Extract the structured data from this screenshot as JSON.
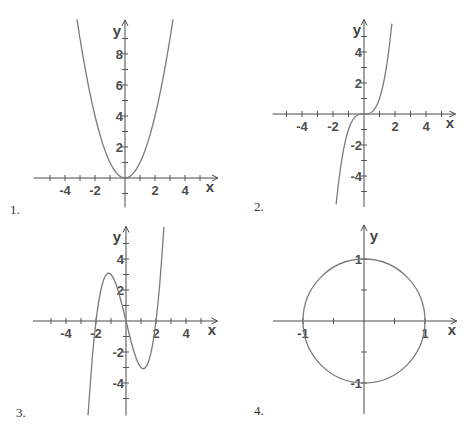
{
  "figure": {
    "panels": [
      {
        "label": "1."
      },
      {
        "label": "2."
      },
      {
        "label": "3."
      },
      {
        "label": "4."
      }
    ]
  },
  "colors": {
    "axis": "#4a4a4a",
    "curve": "#7a7a7a",
    "text": "#4d4d4d"
  },
  "chart_data": [
    {
      "type": "line",
      "title": "1.",
      "function": "y = x^2",
      "xlabel": "x",
      "ylabel": "y",
      "grid": false,
      "xlim": [
        -6.1,
        6.2
      ],
      "ylim": [
        -1.9,
        10.2
      ],
      "xticks": [
        -5,
        -4,
        -3,
        -2,
        -1,
        1,
        2,
        3,
        4,
        5
      ],
      "yticks": [
        -1,
        1,
        2,
        3,
        4,
        5,
        6,
        7,
        8,
        9
      ],
      "xtick_labels": [
        {
          "value": -4,
          "text": "-4"
        },
        {
          "value": -2,
          "text": "-2"
        },
        {
          "value": 2,
          "text": "2"
        },
        {
          "value": 4,
          "text": "4"
        }
      ],
      "ytick_labels": [
        {
          "value": 2,
          "text": "2"
        },
        {
          "value": 4,
          "text": "4"
        },
        {
          "value": 6,
          "text": "6"
        },
        {
          "value": 8,
          "text": "8"
        }
      ],
      "points": [
        [
          -3.2,
          10.24
        ],
        [
          -3.0,
          9
        ],
        [
          -2.8,
          7.84
        ],
        [
          -2.6,
          6.76
        ],
        [
          -2.4,
          5.76
        ],
        [
          -2.2,
          4.84
        ],
        [
          -2.0,
          4
        ],
        [
          -1.8,
          3.24
        ],
        [
          -1.6,
          2.56
        ],
        [
          -1.4,
          1.96
        ],
        [
          -1.2,
          1.44
        ],
        [
          -1.0,
          1
        ],
        [
          -0.8,
          0.64
        ],
        [
          -0.6,
          0.36
        ],
        [
          -0.4,
          0.16
        ],
        [
          -0.2,
          0.04
        ],
        [
          0,
          0
        ],
        [
          0.2,
          0.04
        ],
        [
          0.4,
          0.16
        ],
        [
          0.6,
          0.36
        ],
        [
          0.8,
          0.64
        ],
        [
          1.0,
          1
        ],
        [
          1.2,
          1.44
        ],
        [
          1.4,
          1.96
        ],
        [
          1.6,
          2.56
        ],
        [
          1.8,
          3.24
        ],
        [
          2.0,
          4
        ],
        [
          2.2,
          4.84
        ],
        [
          2.4,
          5.76
        ],
        [
          2.6,
          6.76
        ],
        [
          2.8,
          7.84
        ],
        [
          3.0,
          9
        ],
        [
          3.2,
          10.24
        ]
      ]
    },
    {
      "type": "line",
      "title": "2.",
      "function": "y = x^3",
      "xlabel": "x",
      "ylabel": "y",
      "grid": false,
      "xlim": [
        -5.9,
        5.9
      ],
      "ylim": [
        -6.0,
        6.1
      ],
      "xticks": [
        -5,
        -4,
        -3,
        -2,
        -1,
        1,
        2,
        3,
        4,
        5
      ],
      "yticks": [
        -5,
        -4,
        -3,
        -2,
        -1,
        1,
        2,
        3,
        4,
        5
      ],
      "xtick_labels": [
        {
          "value": -4,
          "text": "-4"
        },
        {
          "value": -2,
          "text": "-2"
        },
        {
          "value": 2,
          "text": "2"
        },
        {
          "value": 4,
          "text": "4"
        }
      ],
      "ytick_labels": [
        {
          "value": 4,
          "text": "4"
        },
        {
          "value": 2,
          "text": "2"
        },
        {
          "value": -2,
          "text": "-2"
        },
        {
          "value": -4,
          "text": "-4"
        }
      ],
      "points": [
        [
          -1.8,
          -5.832
        ],
        [
          -1.6,
          -4.096
        ],
        [
          -1.4,
          -2.744
        ],
        [
          -1.2,
          -1.728
        ],
        [
          -1.0,
          -1
        ],
        [
          -0.8,
          -0.512
        ],
        [
          -0.6,
          -0.216
        ],
        [
          -0.4,
          -0.064
        ],
        [
          -0.2,
          -0.008
        ],
        [
          0,
          0
        ],
        [
          0.2,
          0.008
        ],
        [
          0.4,
          0.064
        ],
        [
          0.6,
          0.216
        ],
        [
          0.8,
          0.512
        ],
        [
          1.0,
          1
        ],
        [
          1.2,
          1.728
        ],
        [
          1.4,
          2.744
        ],
        [
          1.6,
          4.096
        ],
        [
          1.8,
          5.832
        ]
      ]
    },
    {
      "type": "line",
      "title": "3.",
      "function": "y = x^3 - 4x",
      "xlabel": "x",
      "ylabel": "y",
      "grid": false,
      "xlim": [
        -6.2,
        6.1
      ],
      "ylim": [
        -6.1,
        6.1
      ],
      "xticks": [
        -5,
        -4,
        -3,
        -2,
        -1,
        1,
        2,
        3,
        4,
        5
      ],
      "yticks": [
        -5,
        -4,
        -3,
        -2,
        -1,
        1,
        2,
        3,
        4,
        5
      ],
      "xtick_labels": [
        {
          "value": -4,
          "text": "-4"
        },
        {
          "value": -2,
          "text": "-2"
        },
        {
          "value": 2,
          "text": "2"
        },
        {
          "value": 4,
          "text": "4"
        }
      ],
      "ytick_labels": [
        {
          "value": 4,
          "text": "4"
        },
        {
          "value": 2,
          "text": "2"
        },
        {
          "value": -2,
          "text": "-2"
        },
        {
          "value": -4,
          "text": "-4"
        }
      ],
      "points": [
        [
          -2.53,
          -6.074
        ],
        [
          -2.25,
          -2.391
        ],
        [
          -2.0,
          0
        ],
        [
          -1.75,
          1.641
        ],
        [
          -1.5,
          2.625
        ],
        [
          -1.25,
          3.047
        ],
        [
          -1.0,
          3
        ],
        [
          -0.75,
          2.578
        ],
        [
          -0.5,
          1.875
        ],
        [
          -0.25,
          0.984
        ],
        [
          0,
          0
        ],
        [
          0.25,
          -0.984
        ],
        [
          0.5,
          -1.875
        ],
        [
          0.75,
          -2.578
        ],
        [
          1.0,
          -3
        ],
        [
          1.25,
          -3.047
        ],
        [
          1.5,
          -2.625
        ],
        [
          1.75,
          -1.641
        ],
        [
          2.0,
          0
        ],
        [
          2.25,
          2.391
        ],
        [
          2.53,
          6.074
        ]
      ]
    },
    {
      "type": "line",
      "title": "4.",
      "function": "x^2 + y^2 = 1",
      "shape": "circle",
      "center": [
        0,
        0
      ],
      "radius": 1,
      "xlabel": "x",
      "ylabel": "y",
      "grid": false,
      "xlim": [
        -1.49,
        1.52
      ],
      "ylim": [
        -1.5,
        1.55
      ],
      "xticks": [
        -1,
        -0.5,
        0.5,
        1
      ],
      "yticks": [
        -1,
        -0.5,
        0.5,
        1
      ],
      "xtick_labels": [
        {
          "value": -1,
          "text": "-1"
        },
        {
          "value": 1,
          "text": "1"
        }
      ],
      "ytick_labels": [
        {
          "value": 1,
          "text": "1"
        },
        {
          "value": -1,
          "text": "-1"
        }
      ],
      "points": [
        [
          1,
          0
        ],
        [
          0.866,
          0.5
        ],
        [
          0.5,
          0.866
        ],
        [
          0,
          1
        ],
        [
          -0.5,
          0.866
        ],
        [
          -0.866,
          0.5
        ],
        [
          -1,
          0
        ],
        [
          -0.866,
          -0.5
        ],
        [
          -0.5,
          -0.866
        ],
        [
          0,
          -1
        ],
        [
          0.5,
          -0.866
        ],
        [
          0.866,
          -0.5
        ],
        [
          1,
          0
        ]
      ]
    }
  ]
}
